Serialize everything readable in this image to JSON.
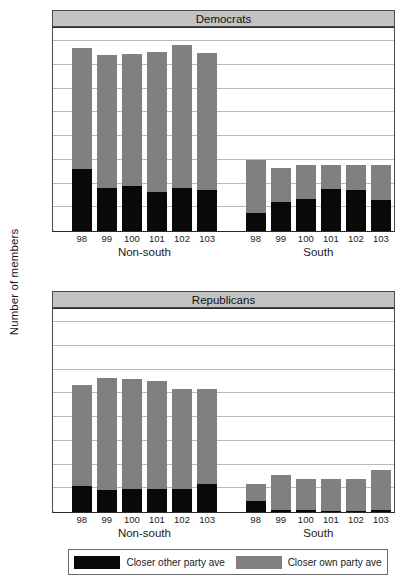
{
  "chart_data": {
    "type": "bar",
    "title": "",
    "xlabel": "",
    "ylabel": "Number of members",
    "ylim": [
      0,
      200
    ],
    "yticks": [
      0,
      25,
      50,
      75,
      100,
      125,
      150,
      175,
      200
    ],
    "grid": true,
    "stacked": true,
    "legend_position": "bottom",
    "legend": [
      {
        "name": "Closer other party ave",
        "color": "#090909"
      },
      {
        "name": "Closer own party ave",
        "color": "#808080"
      }
    ],
    "panels": [
      {
        "title": "Democrats",
        "groups": [
          {
            "label": "Non-south",
            "categories": [
              "98",
              "99",
              "100",
              "101",
              "102",
              "103"
            ],
            "series": [
              {
                "name": "Closer other party ave",
                "values": [
                  65,
                  45,
                  47,
                  41,
                  45,
                  43
                ]
              },
              {
                "name": "Closer own party ave",
                "values": [
                  128,
                  140,
                  139,
                  147,
                  151,
                  144
                ]
              }
            ],
            "totals": [
              193,
              185,
              186,
              188,
              196,
              187
            ]
          },
          {
            "label": "South",
            "categories": [
              "98",
              "99",
              "100",
              "101",
              "102",
              "103"
            ],
            "series": [
              {
                "name": "Closer other party ave",
                "values": [
                  19,
                  31,
                  34,
                  44,
                  43,
                  33
                ]
              },
              {
                "name": "Closer own party ave",
                "values": [
                  56,
                  35,
                  36,
                  26,
                  27,
                  37
                ]
              }
            ],
            "totals": [
              75,
              66,
              70,
              70,
              70,
              70
            ]
          }
        ]
      },
      {
        "title": "Republicans",
        "groups": [
          {
            "label": "Non-south",
            "categories": [
              "98",
              "99",
              "100",
              "101",
              "102",
              "103"
            ],
            "series": [
              {
                "name": "Closer other party ave",
                "values": [
                  27,
                  23,
                  24,
                  24,
                  24,
                  30
                ]
              },
              {
                "name": "Closer own party ave",
                "values": [
                  107,
                  118,
                  116,
                  114,
                  106,
                  100
                ]
              }
            ],
            "totals": [
              134,
              141,
              140,
              138,
              130,
              130
            ]
          },
          {
            "label": "South",
            "categories": [
              "98",
              "99",
              "100",
              "101",
              "102",
              "103"
            ],
            "series": [
              {
                "name": "Closer other party ave",
                "values": [
                  12,
                  2,
                  2,
                  1,
                  1,
                  2
                ]
              },
              {
                "name": "Closer own party ave",
                "values": [
                  18,
                  37,
                  33,
                  34,
                  34,
                  42
                ]
              }
            ],
            "totals": [
              30,
              39,
              35,
              35,
              35,
              44
            ]
          }
        ]
      }
    ]
  },
  "colors": {
    "closer_other": "#090909",
    "closer_own": "#808080",
    "strip_background": "#c3c3c3",
    "gridline": "#b9b9b9",
    "axis": "#2b2b2b"
  }
}
